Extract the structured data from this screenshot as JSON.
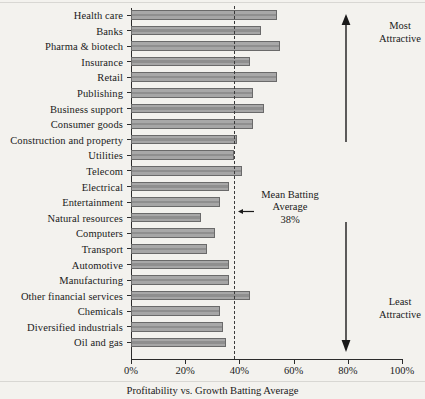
{
  "chart_data": {
    "type": "bar",
    "orientation": "horizontal",
    "title": "",
    "caption": "Profitability vs. Growth Batting Average",
    "xlabel": "",
    "ylabel": "",
    "xlim": [
      0,
      100
    ],
    "xticks": [
      0,
      20,
      40,
      60,
      80,
      100
    ],
    "xtick_labels": [
      "0%",
      "20%",
      "40%",
      "60%",
      "80%",
      "100%"
    ],
    "grid": false,
    "legend": null,
    "categories": [
      "Health care",
      "Banks",
      "Pharma & biotech",
      "Insurance",
      "Retail",
      "Publishing",
      "Business support",
      "Consumer goods",
      "Construction and property",
      "Utilities",
      "Telecom",
      "Electrical",
      "Entertainment",
      "Natural resources",
      "Computers",
      "Transport",
      "Automotive",
      "Manufacturing",
      "Other financial services",
      "Chemicals",
      "Diversified industrials",
      "Oil and gas"
    ],
    "values": [
      54,
      48,
      55,
      44,
      54,
      45,
      49,
      45,
      39,
      38,
      41,
      36,
      33,
      26,
      31,
      28,
      36,
      36,
      44,
      33,
      34,
      35
    ],
    "reference_line": {
      "value": 38,
      "style": "dashed",
      "label_line1": "Mean Batting",
      "label_line2": "Average",
      "label_line3": "38%"
    },
    "annotations": {
      "top_arrow_label_line1": "Most",
      "top_arrow_label_line2": "Attractive",
      "bottom_arrow_label_line1": "Least",
      "bottom_arrow_label_line2": "Attractive"
    },
    "colors": {
      "bar_fill": "#9d9d9d",
      "bar_border": "#6a6a6a",
      "axis": "#2b2b2b",
      "background": "#f3f2ee",
      "text": "#1a1a1a"
    }
  }
}
